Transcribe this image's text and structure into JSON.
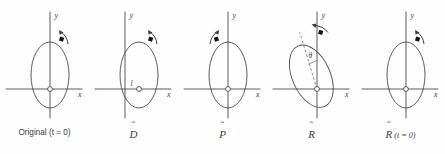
{
  "figure": {
    "background_color": "#fefefe",
    "stroke_color": "#4a4a4a",
    "marker_color": "#1a1a1a",
    "panel_count": 5
  },
  "panels": [
    {
      "id": "original",
      "caption_prefix": "Original (",
      "caption_math": "t",
      "caption_eq": " = 0)",
      "caption_full": "Original (t = 0)",
      "operator": "",
      "hat": "",
      "x_axis_label": "x",
      "y_axis_label": "y",
      "origin_marker": "open-circle",
      "ellipse": {
        "cx": 0,
        "cy": 14,
        "rx": 19,
        "ry": 33,
        "rotation_deg": 0
      },
      "rotation_arrow": "clockwise-top-right",
      "bead_marker": "filled-square",
      "offset_label": "",
      "angle_label": "",
      "dashed_axis": false
    },
    {
      "id": "displaced",
      "caption_prefix": "",
      "caption_math": "D",
      "caption_eq": "",
      "caption_full": "D",
      "operator": "D",
      "hat": "ˆ",
      "x_axis_label": "x",
      "y_axis_label": "y",
      "origin_marker": "open-circle",
      "ellipse": {
        "cx": 0,
        "cy": 14,
        "rx": 19,
        "ry": 33,
        "rotation_deg": 0
      },
      "rotation_arrow": "clockwise-top-right",
      "bead_marker": "filled-square",
      "offset_label": "l",
      "angle_label": "",
      "dashed_axis": false
    },
    {
      "id": "parity",
      "caption_prefix": "",
      "caption_math": "P",
      "caption_eq": "",
      "caption_full": "P",
      "operator": "P",
      "hat": "ˆ",
      "x_axis_label": "x",
      "y_axis_label": "y",
      "origin_marker": "open-circle",
      "ellipse": {
        "cx": 0,
        "cy": 14,
        "rx": 19,
        "ry": 33,
        "rotation_deg": 0
      },
      "rotation_arrow": "counterclockwise-top-left",
      "bead_marker": "filled-square",
      "offset_label": "",
      "angle_label": "",
      "dashed_axis": false
    },
    {
      "id": "rotated",
      "caption_prefix": "",
      "caption_math": "R",
      "caption_eq": "",
      "caption_full": "R",
      "operator": "R",
      "hat": "ˆ",
      "x_axis_label": "x",
      "y_axis_label": "y",
      "origin_marker": "open-circle",
      "ellipse": {
        "cx": 0,
        "cy": 14,
        "rx": 19,
        "ry": 33,
        "rotation_deg": -24
      },
      "rotation_arrow": "clockwise-top",
      "bead_marker": "filled-square",
      "offset_label": "",
      "angle_label": "θ",
      "dashed_axis": true
    },
    {
      "id": "rotated-t0",
      "caption_prefix": "",
      "caption_math": "R",
      "caption_eq": " (t = 0)",
      "caption_full": "R (t = 0)",
      "operator": "R",
      "hat": "ˆ",
      "x_axis_label": "x",
      "y_axis_label": "y",
      "origin_marker": "open-circle",
      "ellipse": {
        "cx": 0,
        "cy": 14,
        "rx": 19,
        "ry": 33,
        "rotation_deg": 0
      },
      "rotation_arrow": "clockwise-top-right",
      "bead_marker": "filled-square",
      "offset_label": "",
      "angle_label": "",
      "dashed_axis": false
    }
  ]
}
